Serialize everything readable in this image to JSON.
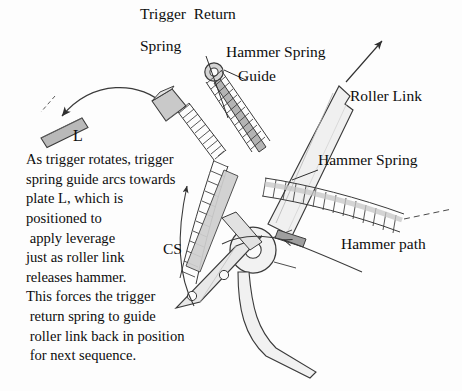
{
  "figure": {
    "title_alt": "Trigger return spring and hammer mechanism diagram",
    "background_color": "#fdfdfd",
    "ink_color": "#111111"
  },
  "callouts": {
    "trigger_return_spring_line1": "Trigger  Return",
    "trigger_return_spring_line2": "Spring",
    "hammer_spring_guide_line1": "Hammer Spring",
    "hammer_spring_guide_line2": "Guide",
    "roller_link": "Roller Link",
    "hammer_spring": "Hammer Spring",
    "hammer_path": "Hammer path",
    "plate_l": "L",
    "cs": "CS"
  },
  "annotation_block": {
    "lines": [
      "As trigger rotates, trigger",
      "spring guide arcs towards",
      "plate L, which is",
      "positioned to",
      " apply leverage",
      "just as roller link",
      "releases hammer.",
      "This forces the trigger",
      " return spring to guide",
      " roller link back in position",
      " for next sequence."
    ]
  },
  "parts": {
    "plate_l_fill": "#b9b9b9",
    "roller_link_fill": "#f0f0f0",
    "spring_band_fill": "#c6c6c6",
    "trigger_guide_fill": "#c9c9c9",
    "hammer_body_fill": "#e8e8e8",
    "outline": "#3a3a3a"
  },
  "icons": {
    "rotation_arrow": "curved-arrow-icon",
    "roller_link_direction_arrow": "arrow-up-right-icon",
    "hammer_path_arrow": "arrow-left-icon",
    "leader_arrow": "leader-arrow-icon"
  }
}
